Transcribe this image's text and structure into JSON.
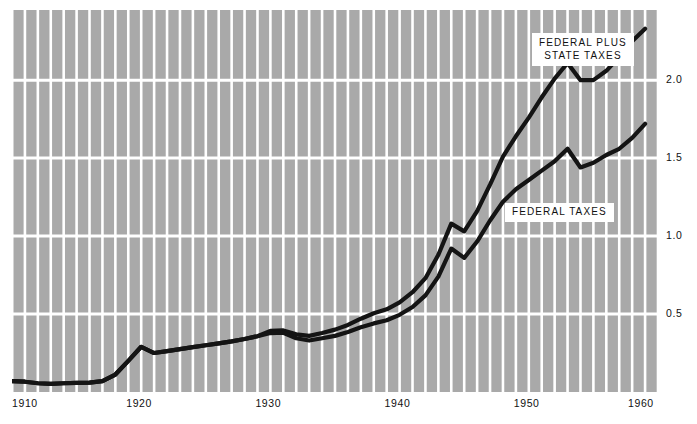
{
  "chart_data": {
    "type": "line",
    "title": "",
    "subtitle": "",
    "xlabel": "",
    "ylabel": "",
    "xlim": [
      1910,
      1960
    ],
    "ylim": [
      0,
      2.45
    ],
    "xticks": [
      1910,
      1920,
      1930,
      1940,
      1950,
      1960
    ],
    "xtick_labels": [
      "1910",
      "1920",
      "1930",
      "1940",
      "1950",
      "1960"
    ],
    "yticks": [
      0.5,
      1.0,
      1.5,
      2.0
    ],
    "ytick_labels": [
      "0.5",
      "1.0",
      "1.5",
      "2.0"
    ],
    "ytick_side": "right",
    "grid": true,
    "grid_x_every": 1,
    "grid_color": "#ffffff",
    "plot_background": "#a9a9a9",
    "line_color": "#141414",
    "legend_position": "inline-annotations",
    "series": [
      {
        "name": "FEDERAL PLUS STATE TAXES",
        "label_lines": [
          "FEDERAL PLUS",
          "STATE TAXES"
        ],
        "x": [
          1910,
          1911,
          1912,
          1913,
          1914,
          1915,
          1916,
          1917,
          1918,
          1919,
          1920,
          1921,
          1922,
          1923,
          1924,
          1925,
          1926,
          1927,
          1928,
          1929,
          1930,
          1931,
          1932,
          1933,
          1934,
          1935,
          1936,
          1937,
          1938,
          1939,
          1940,
          1941,
          1942,
          1943,
          1944,
          1945,
          1946,
          1947,
          1948,
          1949,
          1950,
          1951,
          1952,
          1953,
          1954,
          1955,
          1956,
          1957,
          1958,
          1959
        ],
        "values": [
          0.07,
          0.066,
          0.056,
          0.052,
          0.056,
          0.058,
          0.06,
          0.07,
          0.112,
          0.2,
          0.29,
          0.25,
          0.262,
          0.275,
          0.288,
          0.3,
          0.312,
          0.325,
          0.34,
          0.358,
          0.392,
          0.395,
          0.37,
          0.36,
          0.378,
          0.4,
          0.43,
          0.47,
          0.505,
          0.53,
          0.575,
          0.64,
          0.73,
          0.88,
          1.08,
          1.03,
          1.16,
          1.33,
          1.51,
          1.64,
          1.76,
          1.89,
          2.01,
          2.11,
          2.0,
          2.0,
          2.06,
          2.15,
          2.25,
          2.33
        ]
      },
      {
        "name": "FEDERAL TAXES",
        "label_lines": [
          "FEDERAL TAXES"
        ],
        "x": [
          1910,
          1911,
          1912,
          1913,
          1914,
          1915,
          1916,
          1917,
          1918,
          1919,
          1920,
          1921,
          1922,
          1923,
          1924,
          1925,
          1926,
          1927,
          1928,
          1929,
          1930,
          1931,
          1932,
          1933,
          1934,
          1935,
          1936,
          1937,
          1938,
          1939,
          1940,
          1941,
          1942,
          1943,
          1944,
          1945,
          1946,
          1947,
          1948,
          1949,
          1950,
          1951,
          1952,
          1953,
          1954,
          1955,
          1956,
          1957,
          1958,
          1959
        ],
        "values": [
          0.07,
          0.066,
          0.056,
          0.052,
          0.056,
          0.058,
          0.06,
          0.07,
          0.112,
          0.2,
          0.29,
          0.25,
          0.262,
          0.275,
          0.288,
          0.3,
          0.312,
          0.325,
          0.34,
          0.358,
          0.378,
          0.38,
          0.345,
          0.33,
          0.345,
          0.36,
          0.385,
          0.415,
          0.44,
          0.46,
          0.495,
          0.545,
          0.62,
          0.74,
          0.92,
          0.86,
          0.965,
          1.1,
          1.22,
          1.3,
          1.36,
          1.42,
          1.48,
          1.56,
          1.44,
          1.47,
          1.52,
          1.56,
          1.63,
          1.72
        ]
      }
    ]
  },
  "axis": {
    "y_labels": [
      "2.0",
      "1.5",
      "1.0",
      "0.5"
    ],
    "x_labels": [
      "1910",
      "1920",
      "1930",
      "1940",
      "1950",
      "1960"
    ]
  },
  "legends": {
    "total": {
      "line1": "FEDERAL PLUS",
      "line2": "STATE TAXES"
    },
    "federal": {
      "line1": "FEDERAL TAXES"
    }
  }
}
